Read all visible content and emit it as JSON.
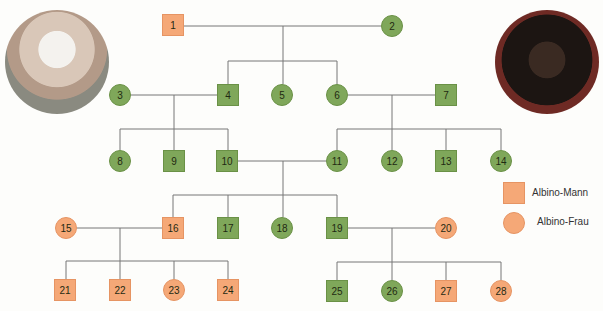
{
  "legend": {
    "male_label": "Albino-Mann",
    "female_label": "Albino-Frau"
  },
  "colors": {
    "affected": "#f5a877",
    "unaffected": "#7fa75a",
    "line": "#777777"
  },
  "photos": [
    {
      "name": "albino-man-photo"
    },
    {
      "name": "woman-photo"
    }
  ],
  "nodes": [
    {
      "id": "1",
      "shape": "square",
      "affected": true,
      "x": 173,
      "y": 25
    },
    {
      "id": "2",
      "shape": "circle",
      "affected": false,
      "x": 392,
      "y": 26
    },
    {
      "id": "3",
      "shape": "circle",
      "affected": false,
      "x": 120,
      "y": 95
    },
    {
      "id": "4",
      "shape": "square",
      "affected": false,
      "x": 228,
      "y": 95
    },
    {
      "id": "5",
      "shape": "circle",
      "affected": false,
      "x": 282,
      "y": 95
    },
    {
      "id": "6",
      "shape": "circle",
      "affected": false,
      "x": 337,
      "y": 95
    },
    {
      "id": "7",
      "shape": "square",
      "affected": false,
      "x": 446,
      "y": 95
    },
    {
      "id": "8",
      "shape": "circle",
      "affected": false,
      "x": 120,
      "y": 161
    },
    {
      "id": "9",
      "shape": "square",
      "affected": false,
      "x": 174,
      "y": 161
    },
    {
      "id": "10",
      "shape": "square",
      "affected": false,
      "x": 227,
      "y": 161
    },
    {
      "id": "11",
      "shape": "circle",
      "affected": false,
      "x": 337,
      "y": 161
    },
    {
      "id": "12",
      "shape": "circle",
      "affected": false,
      "x": 392,
      "y": 161
    },
    {
      "id": "13",
      "shape": "square",
      "affected": false,
      "x": 446,
      "y": 161
    },
    {
      "id": "14",
      "shape": "circle",
      "affected": false,
      "x": 501,
      "y": 161
    },
    {
      "id": "15",
      "shape": "circle",
      "affected": true,
      "x": 66,
      "y": 228
    },
    {
      "id": "16",
      "shape": "square",
      "affected": true,
      "x": 173,
      "y": 228
    },
    {
      "id": "17",
      "shape": "square",
      "affected": false,
      "x": 228,
      "y": 228
    },
    {
      "id": "18",
      "shape": "circle",
      "affected": false,
      "x": 282,
      "y": 228
    },
    {
      "id": "19",
      "shape": "square",
      "affected": false,
      "x": 337,
      "y": 228
    },
    {
      "id": "20",
      "shape": "circle",
      "affected": true,
      "x": 446,
      "y": 228
    },
    {
      "id": "21",
      "shape": "square",
      "affected": true,
      "x": 65,
      "y": 290
    },
    {
      "id": "22",
      "shape": "square",
      "affected": true,
      "x": 120,
      "y": 290
    },
    {
      "id": "23",
      "shape": "circle",
      "affected": true,
      "x": 174,
      "y": 290
    },
    {
      "id": "24",
      "shape": "square",
      "affected": true,
      "x": 228,
      "y": 290
    },
    {
      "id": "25",
      "shape": "square",
      "affected": false,
      "x": 337,
      "y": 291
    },
    {
      "id": "26",
      "shape": "circle",
      "affected": false,
      "x": 392,
      "y": 291
    },
    {
      "id": "27",
      "shape": "square",
      "affected": true,
      "x": 446,
      "y": 291
    },
    {
      "id": "28",
      "shape": "circle",
      "affected": true,
      "x": 501,
      "y": 291
    }
  ]
}
